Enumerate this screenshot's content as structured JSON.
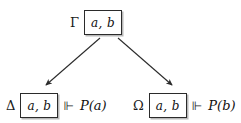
{
  "diagram": {
    "type": "forcing-tree",
    "background_color": "#ffffff",
    "line_color": "#2b2b2b",
    "box_border_color": "#2b2b2b",
    "box_shadow_color": "#b9b9b9",
    "nodes": {
      "root": {
        "context_label": "Γ",
        "box_text": "a, b",
        "forces_symbol": "",
        "formula": ""
      },
      "left": {
        "context_label": "Δ",
        "box_text": "a, b",
        "forces_symbol": "⊩",
        "formula": "P(a)"
      },
      "right": {
        "context_label": "Ω",
        "box_text": "a, b",
        "forces_symbol": "⊩",
        "formula": "P(b)"
      }
    },
    "edges": [
      {
        "name": "edge-root-to-left",
        "from": "root",
        "to": "left",
        "arrowhead": true
      },
      {
        "name": "edge-root-to-right",
        "from": "root",
        "to": "right",
        "arrowhead": true
      }
    ]
  }
}
